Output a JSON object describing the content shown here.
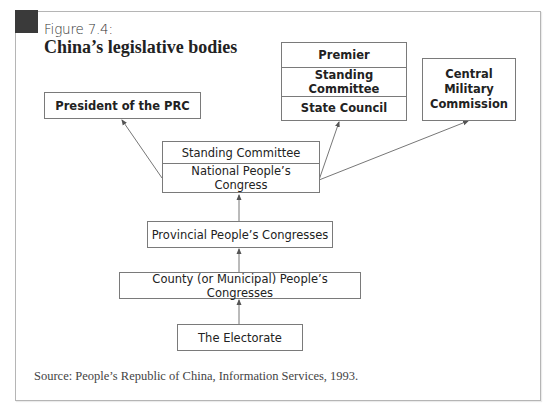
{
  "figure": {
    "label": "Figure 7.4:",
    "title": "China’s legislative bodies",
    "source": "Source: People’s Republic of China, Information Services, 1993."
  },
  "nodes": {
    "president": {
      "label": "President of the PRC"
    },
    "state_council_stack": {
      "cells": [
        {
          "label": "Premier"
        },
        {
          "label": "Standing Committee"
        },
        {
          "label": "State Council"
        }
      ]
    },
    "cmc": {
      "lines": [
        "Central",
        "Military",
        "Commission"
      ]
    },
    "npc_stack": {
      "cells": [
        {
          "label": "Standing Committee"
        },
        {
          "label": "National People’s Congress"
        }
      ]
    },
    "provincial": {
      "label": "Provincial People’s Congresses"
    },
    "county": {
      "label": "County (or Municipal) People’s Congresses"
    },
    "electorate": {
      "label": "The Electorate"
    }
  },
  "edges": [
    {
      "from": "electorate",
      "to": "county"
    },
    {
      "from": "county",
      "to": "provincial"
    },
    {
      "from": "provincial",
      "to": "npc_stack"
    },
    {
      "from": "npc_stack",
      "to": "president"
    },
    {
      "from": "npc_stack",
      "to": "state_council_stack"
    },
    {
      "from": "npc_stack",
      "to": "cmc"
    }
  ],
  "colors": {
    "badge": "#3a3a3a",
    "border": "#7a7a7a",
    "frame": "#b5b5b5"
  }
}
